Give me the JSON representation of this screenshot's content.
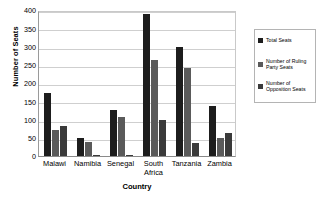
{
  "chart_data": {
    "type": "bar",
    "title": "",
    "xlabel": "Country",
    "ylabel": "Number of Seats",
    "ylim": [
      0,
      400
    ],
    "yticks": [
      0,
      50,
      100,
      150,
      200,
      250,
      300,
      350,
      400
    ],
    "ytick_labels": [
      "0",
      "50",
      "100",
      "150",
      "200",
      "250",
      "300",
      "350",
      "400"
    ],
    "grid": true,
    "legend_position": "right",
    "categories": [
      "Malawi",
      "Namibia",
      "Senegal",
      "South Africa",
      "Tanzania",
      "Zambia"
    ],
    "category_lines": [
      [
        "Malawi"
      ],
      [
        "Namibia"
      ],
      [
        "Senegal"
      ],
      [
        "South",
        "Africa"
      ],
      [
        "Tanzania"
      ],
      [
        "Zambia"
      ]
    ],
    "series": [
      {
        "name": "Total Seats",
        "color": "#1d1d1d",
        "values": [
          172,
          50,
          125,
          390,
          300,
          138
        ]
      },
      {
        "name": "Number of Ruling Party Seats",
        "color": "#5a5a5a",
        "values": [
          72,
          38,
          108,
          262,
          240,
          48
        ]
      },
      {
        "name": "Number of Opposition Seats",
        "color": "#3a3a3a",
        "values": [
          82,
          4,
          3,
          98,
          37,
          64
        ]
      }
    ]
  },
  "legend": {
    "items": [
      {
        "label": "Total Seats"
      },
      {
        "label": "Number of Ruling\nParty Seats"
      },
      {
        "label": "Number of\nOpposition Seats"
      }
    ]
  }
}
